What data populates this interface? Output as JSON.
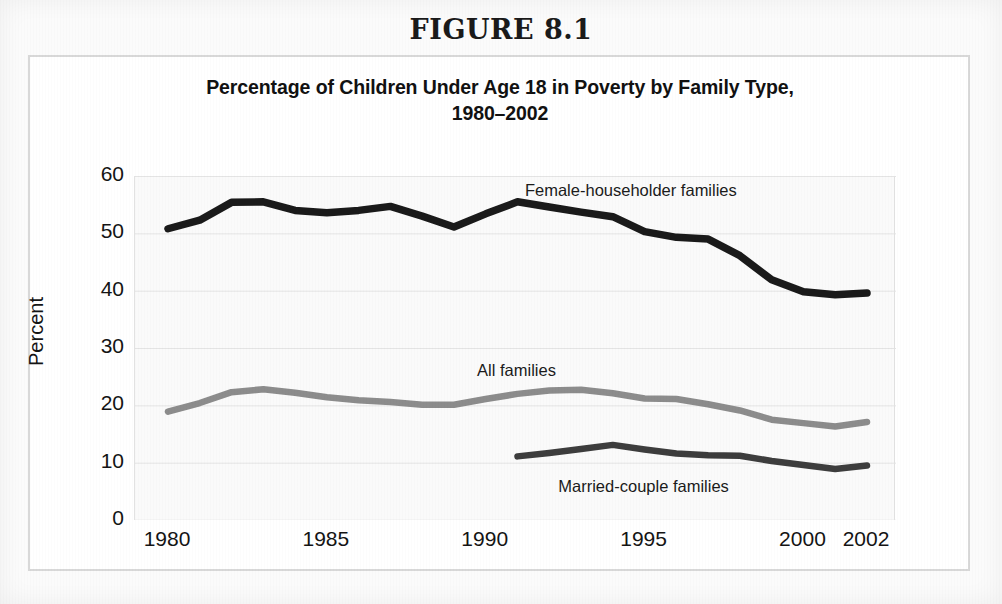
{
  "figure": {
    "number_label": "FIGURE 8.1",
    "title_line1": "Percentage of Children Under Age 18 in Poverty by Family Type,",
    "title_line2": "1980–2002"
  },
  "colors": {
    "female_householder": "#1a1a1a",
    "married_couple": "#3d3d3d",
    "all_families": "#8c8c8c",
    "grid": "#e4e4e4",
    "plot_background": "#fafafa",
    "frame_border": "#d8d8d8",
    "text": "#141414"
  },
  "chart_data": {
    "type": "line",
    "title": "Percentage of Children Under Age 18 in Poverty by Family Type, 1980–2002",
    "xlabel": "",
    "ylabel": "Percent",
    "ylim": [
      0,
      60
    ],
    "xlim": [
      1980,
      2002
    ],
    "ytick_labels": [
      "60",
      "50",
      "40",
      "30",
      "20",
      "10",
      "0"
    ],
    "ytick_values": [
      60,
      50,
      40,
      30,
      20,
      10,
      0
    ],
    "xtick_labels": [
      "1980",
      "1985",
      "1990",
      "1995",
      "2000",
      "2002"
    ],
    "xtick_values": [
      1980,
      1985,
      1990,
      1995,
      2000,
      2002
    ],
    "grid": "horizontal",
    "legend_position": "inline-annotations",
    "x": [
      1980,
      1981,
      1982,
      1983,
      1984,
      1985,
      1986,
      1987,
      1988,
      1989,
      1990,
      1991,
      1992,
      1993,
      1994,
      1995,
      1996,
      1997,
      1998,
      1999,
      2000,
      2001,
      2002
    ],
    "series": [
      {
        "name": "Female-householder families",
        "color": "#1a1a1a",
        "label_x": 1994.6,
        "label_y": 57.2,
        "x": [
          1980,
          1981,
          1982,
          1983,
          1984,
          1985,
          1986,
          1987,
          1988,
          1989,
          1990,
          1991,
          1992,
          1993,
          1994,
          1995,
          1996,
          1997,
          1998,
          1999,
          2000,
          2001,
          2002
        ],
        "values": [
          50.8,
          52.3,
          55.4,
          55.5,
          54.0,
          53.6,
          54.0,
          54.7,
          53.0,
          51.1,
          53.4,
          55.5,
          54.6,
          53.7,
          52.9,
          50.3,
          49.3,
          49.0,
          46.1,
          41.9,
          39.8,
          39.3,
          39.6
        ]
      },
      {
        "name": "All families",
        "color": "#8c8c8c",
        "label_x": 1991.0,
        "label_y": 25.8,
        "x": [
          1980,
          1981,
          1982,
          1983,
          1984,
          1985,
          1986,
          1987,
          1988,
          1989,
          1990,
          1991,
          1992,
          1993,
          1994,
          1995,
          1996,
          1997,
          1998,
          1999,
          2000,
          2001,
          2002
        ],
        "values": [
          18.9,
          20.4,
          22.3,
          22.8,
          22.2,
          21.4,
          20.9,
          20.6,
          20.1,
          20.1,
          21.1,
          22.0,
          22.6,
          22.7,
          22.1,
          21.2,
          21.1,
          20.2,
          19.1,
          17.5,
          16.9,
          16.3,
          17.1
        ]
      },
      {
        "name": "Married-couple families",
        "color": "#3d3d3d",
        "label_x": 1995.0,
        "label_y": 5.6,
        "x": [
          1991,
          1992,
          1993,
          1994,
          1995,
          1996,
          1997,
          1998,
          1999,
          2000,
          2001,
          2002
        ],
        "values": [
          11.1,
          11.7,
          12.4,
          13.1,
          12.3,
          11.6,
          11.3,
          11.2,
          10.3,
          9.6,
          8.9,
          9.5
        ]
      }
    ]
  }
}
